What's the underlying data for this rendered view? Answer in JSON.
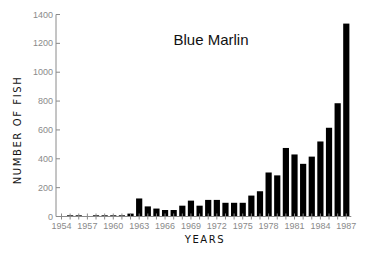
{
  "chart_data": {
    "type": "bar",
    "title": "Blue Marlin",
    "xlabel": "YEARS",
    "ylabel": "NUMBER OF FISH",
    "ylim": [
      0,
      1400
    ],
    "yticks": [
      0,
      200,
      400,
      600,
      800,
      1000,
      1200,
      1400
    ],
    "xtick_labels": [
      "1954",
      "1957",
      "1960",
      "1963",
      "1966",
      "1969",
      "1972",
      "1975",
      "1978",
      "1981",
      "1984",
      "1987"
    ],
    "grid": false,
    "legend": "none",
    "categories": [
      "1954",
      "1955",
      "1956",
      "1957",
      "1958",
      "1959",
      "1960",
      "1961",
      "1962",
      "1963",
      "1964",
      "1965",
      "1966",
      "1967",
      "1968",
      "1969",
      "1970",
      "1971",
      "1972",
      "1973",
      "1974",
      "1975",
      "1976",
      "1977",
      "1978",
      "1979",
      "1980",
      "1981",
      "1982",
      "1983",
      "1984",
      "1985",
      "1986",
      "1987"
    ],
    "values": [
      0,
      8,
      8,
      0,
      2,
      2,
      5,
      8,
      20,
      125,
      70,
      55,
      45,
      45,
      75,
      110,
      75,
      115,
      115,
      95,
      95,
      95,
      145,
      175,
      305,
      285,
      475,
      430,
      365,
      415,
      520,
      615,
      785,
      1337
    ],
    "colors": {
      "bar": "#000000",
      "axis": "#8a8a8a"
    }
  }
}
